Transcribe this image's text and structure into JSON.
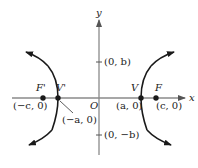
{
  "diagram": {
    "type": "hyperbola",
    "axes": {
      "x_label": "x",
      "y_label": "y",
      "origin_label": "O"
    },
    "y_ticks": [
      {
        "label": "(0, b)"
      },
      {
        "label": "(0, −b)"
      }
    ],
    "points": [
      {
        "name": "F'",
        "coord": "(−c, 0)"
      },
      {
        "name": "V'",
        "coord": "(−a, 0)"
      },
      {
        "name": "V",
        "coord": "(a, 0)"
      },
      {
        "name": "F",
        "coord": "(c, 0)"
      }
    ],
    "colors": {
      "axis": "#8a8a8a",
      "curve": "#1a1a1a",
      "text": "#1a1a1a"
    }
  }
}
